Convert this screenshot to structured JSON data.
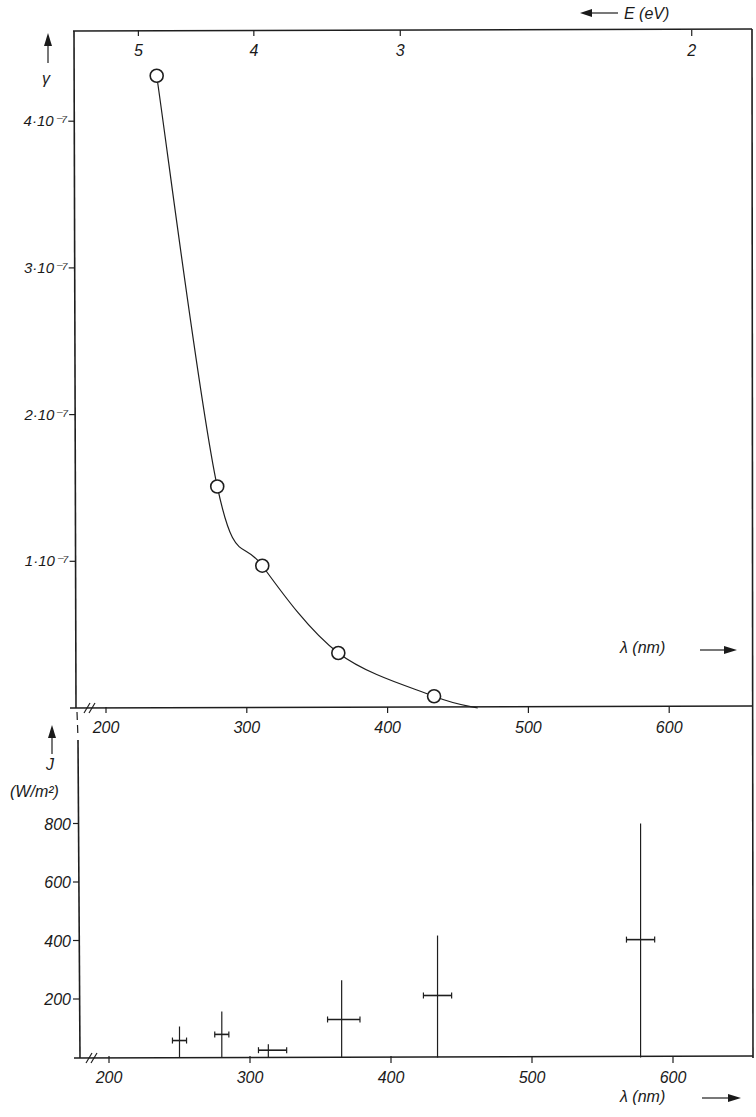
{
  "chart_data": [
    {
      "type": "line",
      "panel": "top",
      "title": "",
      "xlabel": "λ (nm)",
      "ylabel": "γ",
      "top_xlabel": "E (eV)",
      "xlim": [
        177,
        659
      ],
      "ylim": [
        0,
        4.62e-07
      ],
      "x_axis_break": true,
      "grid": false,
      "x_ticks": [
        {
          "value": 200,
          "label": "200"
        },
        {
          "value": 300,
          "label": "300"
        },
        {
          "value": 400,
          "label": "400"
        },
        {
          "value": 500,
          "label": "500"
        },
        {
          "value": 600,
          "label": "600"
        }
      ],
      "y_ticks": [
        {
          "value": 1e-07,
          "label": "1·10⁻⁷"
        },
        {
          "value": 2e-07,
          "label": "2·10⁻⁷"
        },
        {
          "value": 3e-07,
          "label": "3·10⁻⁷"
        },
        {
          "value": 4e-07,
          "label": "4·10⁻⁷"
        }
      ],
      "top_ticks": [
        {
          "label": "5",
          "lambda_nm": 223
        },
        {
          "label": "4",
          "lambda_nm": 305
        },
        {
          "label": "3",
          "lambda_nm": 409
        },
        {
          "label": "2",
          "lambda_nm": 616
        }
      ],
      "series": [
        {
          "name": "γ measured",
          "marker": "open-circle",
          "points": [
            {
              "x": 236,
              "y": 4.31e-07
            },
            {
              "x": 279,
              "y": 1.51e-07
            },
            {
              "x": 311,
              "y": 9.7e-08
            },
            {
              "x": 365,
              "y": 3.75e-08
            },
            {
              "x": 433,
              "y": 8e-09
            }
          ]
        }
      ],
      "fit_curve": [
        {
          "x": 236,
          "y": 4.31e-07
        },
        {
          "x": 279,
          "y": 1.51e-07
        },
        {
          "x": 311,
          "y": 9.7e-08
        },
        {
          "x": 365,
          "y": 3.75e-08
        },
        {
          "x": 433,
          "y": 8e-09
        },
        {
          "x": 464,
          "y": 0
        }
      ]
    },
    {
      "type": "scatter",
      "panel": "bottom",
      "title": "",
      "xlabel": "λ (nm)",
      "ylabel": "J",
      "ylabel_unit": "(W/m²)",
      "xlim": [
        181,
        656
      ],
      "ylim": [
        0,
        1100
      ],
      "x_axis_break": true,
      "grid": false,
      "x_ticks": [
        {
          "value": 200,
          "label": "200"
        },
        {
          "value": 300,
          "label": "300"
        },
        {
          "value": 400,
          "label": "400"
        },
        {
          "value": 500,
          "label": "500"
        },
        {
          "value": 600,
          "label": "600"
        }
      ],
      "y_ticks": [
        {
          "value": 200,
          "label": "200"
        },
        {
          "value": 400,
          "label": "400"
        },
        {
          "value": 600,
          "label": "600"
        },
        {
          "value": 800,
          "label": "800"
        }
      ],
      "series": [
        {
          "name": "J with error bars",
          "points": [
            {
              "x": 250,
              "y": 58,
              "x_range": [
                245,
                255
              ],
              "y_range": [
                0,
                106
              ]
            },
            {
              "x": 280,
              "y": 79,
              "x_range": [
                275,
                285
              ],
              "y_range": [
                0,
                157
              ]
            },
            {
              "x": 313,
              "y": 25,
              "x_range": [
                306,
                326
              ],
              "y_range": [
                0,
                45
              ]
            },
            {
              "x": 365,
              "y": 130,
              "x_range": [
                355,
                378
              ],
              "y_range": [
                0,
                264
              ]
            },
            {
              "x": 433,
              "y": 212,
              "x_range": [
                423,
                443
              ],
              "y_range": [
                0,
                417
              ]
            },
            {
              "x": 577,
              "y": 403,
              "x_range": [
                567,
                587
              ],
              "y_range": [
                0,
                800
              ]
            }
          ]
        }
      ]
    }
  ]
}
